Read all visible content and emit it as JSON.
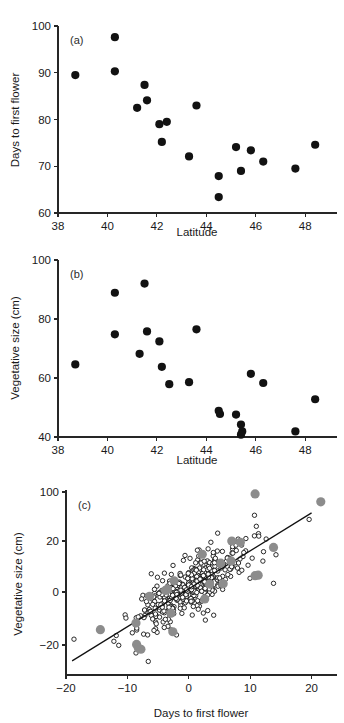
{
  "figure": {
    "background": "#ffffff",
    "point_color_filled": "#121212",
    "point_color_gray": "#8c8c8c",
    "point_color_open_fill": "#ffffff",
    "axis_color": "#262626"
  },
  "chart_data": [
    {
      "type": "scatter",
      "panel": "(a)",
      "title": "",
      "xlabel": "Latitude",
      "ylabel": "Days to first flower",
      "xlim": [
        38,
        49
      ],
      "ylim": [
        60,
        100
      ],
      "xticks": [
        38,
        40,
        42,
        44,
        46,
        48
      ],
      "yticks": [
        60,
        70,
        80,
        90,
        100
      ],
      "grid": false,
      "legend": "none",
      "series": [
        {
          "name": "populations",
          "marker": "filled-circle",
          "color": "#121212",
          "points": [
            [
              38.7,
              89.5
            ],
            [
              40.3,
              97.6
            ],
            [
              40.3,
              90.3
            ],
            [
              41.5,
              87.4
            ],
            [
              41.2,
              82.5
            ],
            [
              41.6,
              84.1
            ],
            [
              42.1,
              79.0
            ],
            [
              42.4,
              79.5
            ],
            [
              42.2,
              75.2
            ],
            [
              43.6,
              83.0
            ],
            [
              43.3,
              72.1
            ],
            [
              44.5,
              67.9
            ],
            [
              44.5,
              63.4
            ],
            [
              45.2,
              74.1
            ],
            [
              45.4,
              69.0
            ],
            [
              45.8,
              73.4
            ],
            [
              46.3,
              71.0
            ],
            [
              47.6,
              69.5
            ],
            [
              48.4,
              74.6
            ]
          ]
        }
      ]
    },
    {
      "type": "scatter",
      "panel": "(b)",
      "title": "",
      "xlabel": "Latitude",
      "ylabel": "Vegetative size (cm)",
      "xlim": [
        38,
        49
      ],
      "ylim": [
        40,
        100
      ],
      "xticks": [
        38,
        40,
        42,
        44,
        46,
        48
      ],
      "yticks": [
        40,
        60,
        80,
        100
      ],
      "grid": false,
      "legend": "none",
      "series": [
        {
          "name": "populations",
          "marker": "filled-circle",
          "color": "#121212",
          "points": [
            [
              38.7,
              64.6
            ],
            [
              40.3,
              88.9
            ],
            [
              40.3,
              74.8
            ],
            [
              41.5,
              92.0
            ],
            [
              41.6,
              75.8
            ],
            [
              41.3,
              68.2
            ],
            [
              42.1,
              72.4
            ],
            [
              42.2,
              63.8
            ],
            [
              42.5,
              57.9
            ],
            [
              43.3,
              58.6
            ],
            [
              43.6,
              76.5
            ],
            [
              44.5,
              48.9
            ],
            [
              44.55,
              47.8
            ],
            [
              45.2,
              47.6
            ],
            [
              45.4,
              44.2
            ],
            [
              45.45,
              41.9
            ],
            [
              45.4,
              40.8
            ],
            [
              45.8,
              61.4
            ],
            [
              46.3,
              58.3
            ],
            [
              47.6,
              41.9
            ],
            [
              48.4,
              52.8
            ]
          ]
        }
      ]
    },
    {
      "type": "scatter",
      "panel": "(c)",
      "title": "",
      "xlabel": "Days to first flower",
      "ylabel": "Vegetative size (cm)",
      "xlim": [
        -20,
        23
      ],
      "ylim": [
        -28,
        42
      ],
      "xticks": [
        -20,
        -10,
        0,
        10,
        20
      ],
      "yticks": [
        -20,
        0,
        20,
        100
      ],
      "ytick_labels": [
        "−20",
        "0",
        "20",
        "100"
      ],
      "grid": false,
      "legend": "none",
      "regression_line": {
        "x_start": -19.0,
        "y_start": -26.0,
        "x_end": 20.0,
        "y_end": 31.5,
        "color": "#111111"
      },
      "series": [
        {
          "name": "family-means",
          "marker": "filled-circle-gray",
          "color": "#8c8c8c",
          "radius_px": 4.6,
          "points": [
            [
              10.8,
              39.2
            ],
            [
              21.5,
              36.0
            ],
            [
              13.8,
              17.5
            ],
            [
              7.0,
              20.0
            ],
            [
              8.4,
              19.5
            ],
            [
              5.2,
              11.3
            ],
            [
              2.2,
              14.8
            ],
            [
              10.8,
              6.4
            ],
            [
              11.3,
              6.6
            ],
            [
              -2.4,
              4.4
            ],
            [
              -3.8,
              0.6
            ],
            [
              -3.5,
              1.1
            ],
            [
              2.6,
              -2.6
            ],
            [
              -6.4,
              -1.6
            ],
            [
              -2.9,
              -8.0
            ],
            [
              -14.4,
              -14.2
            ],
            [
              -2.6,
              -15.0
            ],
            [
              -8.6,
              -11.7
            ],
            [
              -8.5,
              -19.8
            ],
            [
              -8.2,
              -21.2
            ],
            [
              -7.8,
              -21.6
            ],
            [
              6.9,
              12.2
            ],
            [
              3.4,
              3.1
            ],
            [
              5.6,
              3.2
            ]
          ]
        },
        {
          "name": "individual-plants",
          "marker": "open-circle",
          "color": "#141414",
          "radius_px": 2.2,
          "n_points": 420,
          "x_mean": 0.3,
          "y_mean": 2.0,
          "x_sd": 4.0,
          "y_sd": 7.0,
          "correlation": 0.78,
          "extra_points": [
            [
              -18.7,
              -17.8
            ],
            [
              -12.2,
              -18.6
            ],
            [
              -9.2,
              -15.4
            ],
            [
              -8.6,
              -23.0
            ],
            [
              -6.6,
              -26.2
            ],
            [
              -6.7,
              -16.2
            ],
            [
              -6.9,
              -3.6
            ],
            [
              -6.8,
              -1.4
            ],
            [
              -7.2,
              -6.8
            ],
            [
              -6.2,
              -7.3
            ],
            [
              -5.3,
              -12.0
            ],
            [
              -4.0,
              -13.4
            ],
            [
              -2.0,
              -16.2
            ],
            [
              2.7,
              -10.6
            ],
            [
              4.7,
              23.2
            ],
            [
              10.7,
              30.5
            ],
            [
              11.0,
              26.0
            ],
            [
              11.4,
              22.0
            ],
            [
              12.6,
              20.8
            ],
            [
              14.2,
              14.6
            ],
            [
              13.8,
              3.4
            ],
            [
              19.6,
              28.8
            ],
            [
              9.3,
              21.0
            ],
            [
              8.6,
              18.4
            ],
            [
              3.6,
              19.5
            ],
            [
              1.4,
              16.4
            ],
            [
              0.2,
              13.2
            ]
          ]
        }
      ]
    }
  ]
}
